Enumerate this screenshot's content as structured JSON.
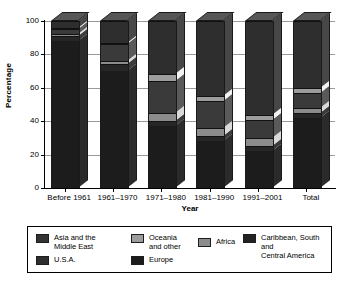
{
  "chart_data": {
    "type": "bar",
    "subtype": "stacked-column-100",
    "title": "",
    "xlabel": "Year",
    "ylabel": "Percentage",
    "ylim": [
      0,
      100
    ],
    "yticks": [
      0,
      20,
      40,
      60,
      80,
      100
    ],
    "grid": true,
    "legend_position": "bottom",
    "categories": [
      "Before 1961",
      "1961–1970",
      "1971–1980",
      "1981–1990",
      "1991–2001",
      "Total"
    ],
    "series": [
      {
        "name": "Europe",
        "color": "#1c1c1c",
        "values": [
          88,
          70,
          37,
          28,
          22,
          42
        ]
      },
      {
        "name": "Caribbean, South and Central America",
        "color": "#262626",
        "values": [
          3,
          4,
          3,
          3,
          3,
          3
        ]
      },
      {
        "name": "Africa",
        "color": "#8c8c8c",
        "values": [
          1,
          2,
          5,
          5,
          5,
          3
        ]
      },
      {
        "name": "Asia and the Middle East",
        "color": "#3a3a3a",
        "values": [
          3,
          10,
          19,
          16,
          11,
          9
        ]
      },
      {
        "name": "Oceania and other",
        "color": "#9d9d9d",
        "values": [
          1,
          1,
          4,
          3,
          3,
          3
        ]
      },
      {
        "name": "U.S.A.",
        "color": "#2e2e2e",
        "values": [
          4,
          13,
          32,
          45,
          56,
          40
        ]
      }
    ],
    "stack_order_bottom_to_top": [
      "Europe",
      "Caribbean, South and Central America",
      "Africa",
      "Asia and the Middle East",
      "Oceania and other",
      "U.S.A."
    ]
  },
  "legend": {
    "items": [
      {
        "label": "Asia and the\nMiddle East",
        "color": "#333333"
      },
      {
        "label": "Oceania\nand other",
        "color": "#9d9d9d"
      },
      {
        "label": "Africa",
        "color": "#8c8c8c"
      },
      {
        "label": "Caribbean, South and\nCentral America",
        "color": "#222222"
      },
      {
        "label": "U.S.A.",
        "color": "#2e2e2e"
      },
      {
        "label": "Europe",
        "color": "#1c1c1c"
      }
    ]
  }
}
